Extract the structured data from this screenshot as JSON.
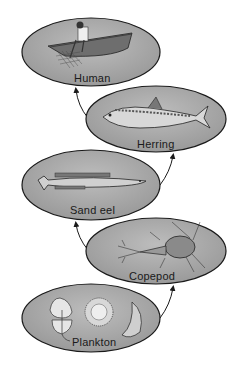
{
  "diagram": {
    "type": "food-chain",
    "direction": "bottom-to-top",
    "nodes": [
      {
        "id": "human",
        "label": "Human",
        "illustration": "fisherman-in-boat-with-net"
      },
      {
        "id": "herring",
        "label": "Herring",
        "illustration": "herring-fish"
      },
      {
        "id": "sand_eel",
        "label": "Sand eel",
        "illustration": "sand-eel-fish"
      },
      {
        "id": "copepod",
        "label": "Copepod",
        "illustration": "copepod-crustacean"
      },
      {
        "id": "plankton",
        "label": "Plankton",
        "illustration": "phytoplankton-cells"
      }
    ],
    "edges": [
      {
        "from": "plankton",
        "to": "copepod"
      },
      {
        "from": "copepod",
        "to": "sand_eel"
      },
      {
        "from": "sand_eel",
        "to": "herring"
      },
      {
        "from": "herring",
        "to": "human"
      }
    ],
    "colors": {
      "ellipse_fill": "#a9a9a9",
      "ellipse_stroke": "#1a1a1a",
      "arrow": "#1a1a1a"
    }
  }
}
